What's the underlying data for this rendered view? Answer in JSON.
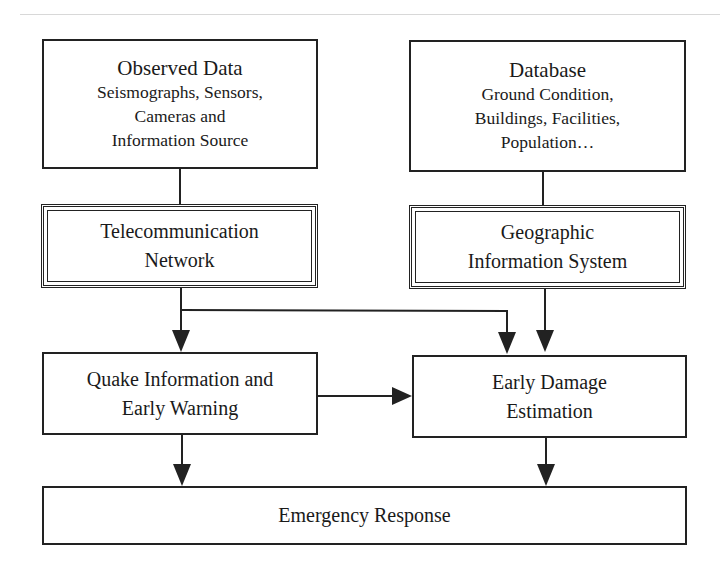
{
  "diagram": {
    "nodes": {
      "observed": {
        "title": "Observed Data",
        "lines": [
          "Seismographs, Sensors,",
          "Cameras and",
          "Information Source"
        ]
      },
      "database": {
        "title": "Database",
        "lines": [
          "Ground Condition,",
          "Buildings, Facilities,",
          "Population…"
        ]
      },
      "telecom": {
        "lines": [
          "Telecommunication",
          "Network"
        ]
      },
      "gis": {
        "lines": [
          "Geographic",
          "Information System"
        ]
      },
      "quake": {
        "lines": [
          "Quake Information and",
          "Early Warning"
        ]
      },
      "damage": {
        "lines": [
          "Early Damage",
          "Estimation"
        ]
      },
      "emergency": {
        "lines": [
          "Emergency Response"
        ]
      }
    },
    "edges": [
      {
        "from": "observed",
        "to": "telecom"
      },
      {
        "from": "database",
        "to": "gis"
      },
      {
        "from": "telecom",
        "to": "quake"
      },
      {
        "from": "telecom",
        "to": "damage"
      },
      {
        "from": "gis",
        "to": "damage"
      },
      {
        "from": "quake",
        "to": "damage"
      },
      {
        "from": "quake",
        "to": "emergency"
      },
      {
        "from": "damage",
        "to": "emergency"
      }
    ],
    "line_color": "#222222"
  }
}
